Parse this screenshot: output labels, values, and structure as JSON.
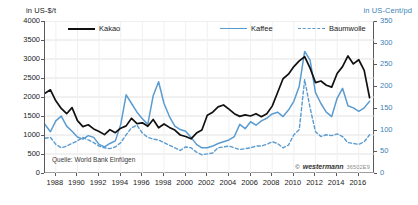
{
  "axes": {
    "left_unit": "in US-$/t",
    "right_unit": "in US-Cent/pd",
    "left_ticks": [
      "4000",
      "3500",
      "3000",
      "2500",
      "2000",
      "1500",
      "1000",
      "500",
      "0"
    ],
    "right_ticks": [
      "350",
      "300",
      "250",
      "200",
      "150",
      "100",
      "50",
      "0"
    ],
    "x_ticks": [
      "1988",
      "1990",
      "1992",
      "1994",
      "1996",
      "1998",
      "2000",
      "2002",
      "2004",
      "2006",
      "2008",
      "2010",
      "2012",
      "2014",
      "2016"
    ]
  },
  "legend": {
    "kakao": "Kakao",
    "kaffee": "Kaffee",
    "baumwolle": "Baumwolle"
  },
  "source": "Quelle: World Bank Einfügen",
  "credit": {
    "symbol": "©",
    "brand": "westermann",
    "code": "36502E9"
  },
  "colors": {
    "kakao": "#111111",
    "kaffee": "#5a9bd0",
    "baumwolle": "#5a9bd0",
    "right_axis_text": "#3d7fb8",
    "grid": "#e2e2e2",
    "axis": "#5a5a5a"
  },
  "chart_data": {
    "type": "line",
    "title": "",
    "subtitle": "",
    "xlabel": "",
    "ylabel": "in US-$/t",
    "y2label": "in US-Cent/pd",
    "grid": true,
    "legend_position": "top",
    "xlim": [
      1987.0,
      2017.5
    ],
    "ylim": [
      0,
      4000
    ],
    "y2lim": [
      0,
      350
    ],
    "x_tick_interval": 2,
    "x": [
      1987.0,
      1987.5,
      1988.0,
      1988.5,
      1989.0,
      1989.5,
      1990.0,
      1990.5,
      1991.0,
      1991.5,
      1992.0,
      1992.5,
      1993.0,
      1993.5,
      1994.0,
      1994.5,
      1995.0,
      1995.5,
      1996.0,
      1996.5,
      1997.0,
      1997.5,
      1998.0,
      1998.5,
      1999.0,
      1999.5,
      2000.0,
      2000.5,
      2001.0,
      2001.5,
      2002.0,
      2002.5,
      2003.0,
      2003.5,
      2004.0,
      2004.5,
      2005.0,
      2005.5,
      2006.0,
      2006.5,
      2007.0,
      2007.5,
      2008.0,
      2008.5,
      2009.0,
      2009.5,
      2010.0,
      2010.5,
      2011.0,
      2011.5,
      2012.0,
      2012.5,
      2013.0,
      2013.5,
      2014.0,
      2014.5,
      2015.0,
      2015.5,
      2016.0,
      2016.5,
      2017.0
    ],
    "series": [
      {
        "name": "Kakao",
        "axis": "left",
        "unit": "US-$/t",
        "style": "solid",
        "color": "#111111",
        "values": [
          2100,
          2190,
          1900,
          1700,
          1560,
          1720,
          1380,
          1220,
          1270,
          1160,
          1090,
          1010,
          1140,
          1060,
          1180,
          1240,
          1440,
          1300,
          1320,
          1230,
          1410,
          1190,
          1290,
          1200,
          1130,
          1000,
          960,
          900,
          1050,
          1130,
          1520,
          1600,
          1740,
          1790,
          1680,
          1560,
          1490,
          1530,
          1500,
          1560,
          1480,
          1560,
          1760,
          2120,
          2480,
          2600,
          2800,
          2950,
          3060,
          2760,
          2380,
          2420,
          2310,
          2260,
          2620,
          2800,
          3080,
          2870,
          2980,
          2700,
          1980
        ]
      },
      {
        "name": "Kaffee",
        "axis": "right",
        "unit": "US-Cent/pd",
        "style": "solid",
        "color": "#5a9bd0",
        "values": [
          112,
          95,
          120,
          131,
          108,
          96,
          83,
          78,
          86,
          82,
          66,
          60,
          68,
          74,
          112,
          180,
          160,
          140,
          125,
          112,
          178,
          210,
          160,
          130,
          108,
          100,
          96,
          82,
          66,
          58,
          58,
          62,
          68,
          72,
          76,
          84,
          112,
          102,
          118,
          110,
          120,
          126,
          136,
          140,
          130,
          145,
          165,
          200,
          280,
          260,
          185,
          160,
          140,
          130,
          172,
          195,
          155,
          150,
          142,
          150,
          165
        ]
      },
      {
        "name": "Baumwolle",
        "axis": "right",
        "unit": "US-Cent/pd",
        "style": "dashed",
        "color": "#5a9bd0",
        "values": [
          80,
          82,
          66,
          58,
          62,
          68,
          74,
          82,
          76,
          70,
          62,
          58,
          56,
          60,
          70,
          88,
          104,
          110,
          92,
          82,
          78,
          76,
          70,
          64,
          58,
          52,
          60,
          58,
          48,
          42,
          44,
          46,
          58,
          60,
          62,
          58,
          54,
          56,
          58,
          62,
          62,
          66,
          72,
          68,
          58,
          64,
          88,
          100,
          215,
          150,
          95,
          84,
          88,
          86,
          90,
          84,
          70,
          68,
          66,
          72,
          88
        ]
      }
    ]
  }
}
